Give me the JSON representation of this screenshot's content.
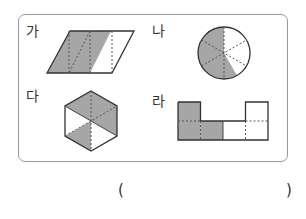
{
  "problem": {
    "figures": [
      {
        "id": "ga",
        "label": "가",
        "shape": "parallelogram",
        "parts": 4,
        "shaded_parts": 3
      },
      {
        "id": "na",
        "label": "나",
        "shape": "circle",
        "parts": 6,
        "shaded_parts": 4
      },
      {
        "id": "da",
        "label": "다",
        "shape": "hexagon",
        "parts": 6,
        "shaded_parts": 4
      },
      {
        "id": "ra",
        "label": "라",
        "shape": "u-shape-squares",
        "parts": 6,
        "shaded_parts": 3
      }
    ],
    "answer": {
      "open_paren": "(",
      "close_paren": ")",
      "value": ""
    }
  },
  "colors": {
    "shade": "#a6a6a6",
    "outline": "#333333",
    "dash": "#555555",
    "panel_border": "#9a9a9a"
  }
}
